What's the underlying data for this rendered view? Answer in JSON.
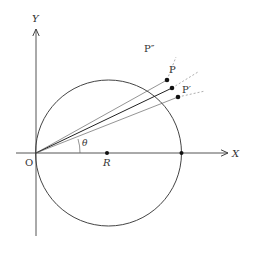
{
  "diagram": {
    "axes": {
      "x_label": "X",
      "y_label": "Y",
      "origin_label": "O"
    },
    "circle": {
      "center_label": "R"
    },
    "angle_label": "θ",
    "points": [
      {
        "id": "p_double_prime",
        "label": "P″"
      },
      {
        "id": "p",
        "label": "P"
      },
      {
        "id": "p_prime",
        "label": "P′"
      }
    ],
    "colors": {
      "line": "#444444",
      "dashed": "#999999",
      "dot": "#111111"
    }
  }
}
